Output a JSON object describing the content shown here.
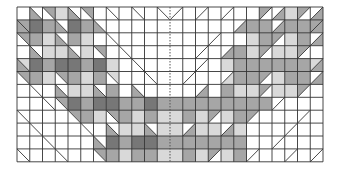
{
  "diagram": {
    "type": "quilt-block-grid",
    "rows": 12,
    "cols": 24,
    "origin": [
      17,
      7
    ],
    "cell_w": 12.75,
    "cell_h": 12.9,
    "center_divider": "dashed",
    "colors": {
      "W": "#ffffff",
      "L": "#d9d9d9",
      "M": "#a6a6a6",
      "D": "#777777",
      "grid": "#333333"
    },
    "legend_note": "Each cell: solid code, or 'tr/bl' diagonal split. Left half uses \\ diagonal, right half uses / diagonal.",
    "left_half": [
      [
        "W",
        "W/M",
        "M/W",
        "L",
        "W/M",
        "M/W",
        "W",
        "W/W",
        "W",
        "W/W",
        "W",
        "W/W"
      ],
      [
        "M/M",
        "D",
        "M",
        "W/M",
        "D",
        "M",
        "W/M",
        "W",
        "W",
        "W",
        "W",
        "W"
      ],
      [
        "M/W",
        "M",
        "L",
        "W/M",
        "M",
        "L",
        "W",
        "W/W",
        "W",
        "W",
        "W",
        "W"
      ],
      [
        "W",
        "W/M",
        "L",
        "L",
        "W/M",
        "L",
        "M/W",
        "W",
        "W/W",
        "W",
        "W",
        "W"
      ],
      [
        "L/M",
        "D",
        "M",
        "D",
        "D",
        "M",
        "D",
        "L",
        "W",
        "W/W",
        "W",
        "W"
      ],
      [
        "M/W",
        "M",
        "L",
        "M/W",
        "M",
        "L",
        "M",
        "L/W",
        "W",
        "W",
        "W/W",
        "W"
      ],
      [
        "W",
        "W/W",
        "W",
        "W/M",
        "L",
        "L",
        "W/M",
        "M",
        "W",
        "W/M",
        "W",
        "W"
      ],
      [
        "W",
        "W",
        "W/W",
        "M/W",
        "D",
        "M",
        "D",
        "D",
        "M",
        "M",
        "D",
        "M"
      ],
      [
        "W/W",
        "W",
        "W",
        "W",
        "M/W",
        "M",
        "L",
        "M/W",
        "M",
        "L",
        "M",
        "L"
      ],
      [
        "W",
        "W/W",
        "W",
        "W",
        "W",
        "W/W",
        "W",
        "W/M",
        "L",
        "L",
        "W/M",
        "L"
      ],
      [
        "W",
        "W",
        "W/W",
        "W",
        "W",
        "W",
        "W/M",
        "D",
        "M",
        "D",
        "D",
        "M"
      ],
      [
        "W/W",
        "W",
        "W",
        "W/W",
        "W",
        "W",
        "M/W",
        "M",
        "L",
        "M",
        "M",
        "L"
      ]
    ],
    "right_half": [
      [
        "W/W",
        "W",
        "W/W",
        "W",
        "W/W",
        "W",
        "W",
        "M/W",
        "W/M",
        "L",
        "M/W",
        "W/M"
      ],
      [
        "W",
        "W",
        "W",
        "W",
        "W",
        "W/M",
        "M",
        "M",
        "W/M",
        "M",
        "M",
        "M/M"
      ],
      [
        "W",
        "W",
        "W",
        "W/W",
        "W",
        "W",
        "L",
        "M",
        "M/W",
        "L",
        "M",
        "W/M"
      ],
      [
        "W",
        "W",
        "W/W",
        "W",
        "W/M",
        "M",
        "L",
        "M/W",
        "L",
        "L",
        "M/W",
        "W"
      ],
      [
        "W",
        "W",
        "W/W",
        "W",
        "L",
        "M",
        "M",
        "M",
        "M",
        "M",
        "M",
        "L/M"
      ],
      [
        "W",
        "W/W",
        "W",
        "W",
        "W/L",
        "M",
        "M",
        "M/W",
        "L",
        "M",
        "M",
        "W/M"
      ],
      [
        "W",
        "W",
        "W/M",
        "W",
        "M",
        "L",
        "L",
        "M/W",
        "L",
        "L",
        "M/W",
        "W"
      ],
      [
        "M",
        "M",
        "M",
        "M",
        "M",
        "M",
        "M",
        "M",
        "W/W",
        "W",
        "W",
        "W"
      ],
      [
        "L",
        "M",
        "L",
        "M/W",
        "L",
        "M",
        "M/W",
        "W",
        "W",
        "W",
        "W/W",
        "W"
      ],
      [
        "L",
        "W/M",
        "L",
        "L",
        "W/M",
        "L",
        "W",
        "W",
        "W",
        "W/W",
        "W",
        "W"
      ],
      [
        "M",
        "M",
        "M",
        "M",
        "M",
        "M",
        "W",
        "W",
        "W/W",
        "W",
        "W",
        "W"
      ],
      [
        "L",
        "M",
        "L",
        "M/W",
        "L",
        "M",
        "W/W",
        "W",
        "W",
        "W/W",
        "W",
        "W/W"
      ]
    ]
  }
}
